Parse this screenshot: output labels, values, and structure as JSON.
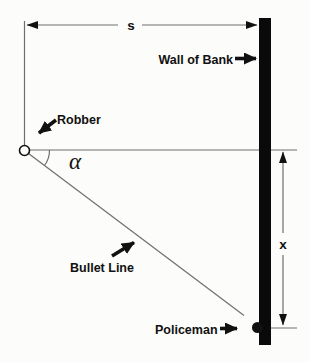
{
  "diagram": {
    "labels": {
      "distance_s": "s",
      "wall_of_bank": "Wall of Bank",
      "robber": "Robber",
      "angle_alpha": "α",
      "bullet_line": "Bullet Line",
      "policeman": "Policeman",
      "distance_x": "x"
    },
    "colors": {
      "background": "#fcfcfa",
      "ink": "#111111",
      "line": "#6f6f6f",
      "wall": "#0a0a0a"
    }
  }
}
